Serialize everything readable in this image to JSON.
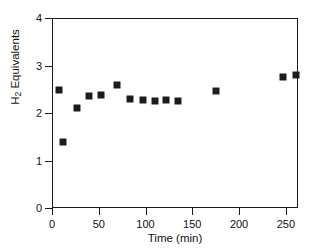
{
  "chart_data": {
    "type": "scatter",
    "title": "",
    "xlabel": "Time (min)",
    "ylabel": "H2 Equivalents",
    "ylabel_parts": {
      "pre": "H",
      "sub": "2",
      "post": " Equivalents"
    },
    "xlim": [
      0,
      263
    ],
    "ylim": [
      0,
      4
    ],
    "grid": false,
    "legend": null,
    "xticks": [
      0,
      50,
      100,
      150,
      200,
      250
    ],
    "xtick_labels": [
      "0",
      "50",
      "100",
      "150",
      "200",
      "250"
    ],
    "yticks": [
      0,
      1,
      2,
      3,
      4
    ],
    "ytick_labels": [
      "0",
      "1",
      "2",
      "3",
      "4"
    ],
    "marker": "square",
    "marker_color": "#1c1c1c",
    "series": [
      {
        "name": "H2 uptake",
        "points": [
          {
            "x": 7,
            "y": 2.48
          },
          {
            "x": 12,
            "y": 1.4
          },
          {
            "x": 27,
            "y": 2.1
          },
          {
            "x": 40,
            "y": 2.36
          },
          {
            "x": 52,
            "y": 2.38
          },
          {
            "x": 70,
            "y": 2.58
          },
          {
            "x": 83,
            "y": 2.29
          },
          {
            "x": 97,
            "y": 2.28
          },
          {
            "x": 110,
            "y": 2.25
          },
          {
            "x": 122,
            "y": 2.28
          },
          {
            "x": 135,
            "y": 2.25
          },
          {
            "x": 175,
            "y": 2.46
          },
          {
            "x": 247,
            "y": 2.75
          },
          {
            "x": 261,
            "y": 2.8
          }
        ]
      }
    ]
  },
  "axes": {
    "frame_color": "#1a1a1a"
  }
}
